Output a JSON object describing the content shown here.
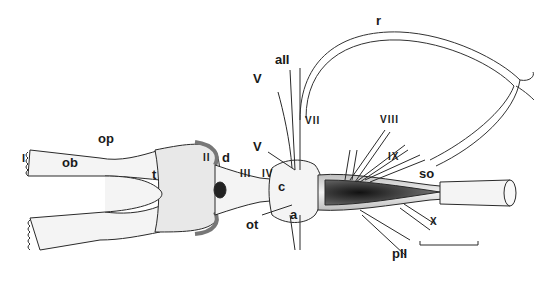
{
  "figure": {
    "colors": {
      "outline": "#2a2a2a",
      "fill": "#f4f4f4",
      "shade": "#9a9a9a",
      "dark": "#1e1e1e",
      "background": "#ffffff"
    },
    "labels": {
      "I": "I",
      "ob": "ob",
      "op": "op",
      "t": "t",
      "II": "II",
      "d": "d",
      "III": "III",
      "IV": "IV",
      "ot": "ot",
      "c": "c",
      "a": "a",
      "V_upper": "V",
      "V_lower": "V",
      "aII": "aII",
      "r": "r",
      "VII": "VII",
      "VIII": "VIII",
      "IX": "IX",
      "so": "so",
      "X": "X",
      "pII": "pII"
    },
    "scale_bar": {
      "present": true
    }
  }
}
